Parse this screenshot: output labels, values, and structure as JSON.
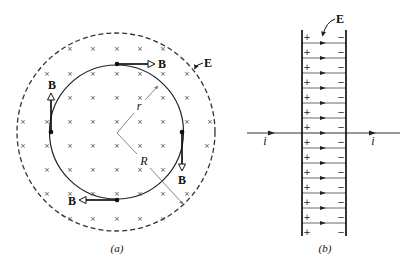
{
  "figure_a": {
    "caption": "(a)",
    "field_label": "E",
    "magnetic_label": "B",
    "inner_radius_label": "r",
    "outer_radius_label": "R",
    "cross_glyph": "×",
    "crosses": [
      [
        70,
        48
      ],
      [
        93,
        48
      ],
      [
        117,
        48
      ],
      [
        140,
        48
      ],
      [
        163,
        48
      ],
      [
        47,
        73
      ],
      [
        70,
        73
      ],
      [
        93,
        73
      ],
      [
        117,
        73
      ],
      [
        140,
        73
      ],
      [
        163,
        73
      ],
      [
        187,
        73
      ],
      [
        70,
        97
      ],
      [
        93,
        97
      ],
      [
        117,
        97
      ],
      [
        140,
        97
      ],
      [
        163,
        97
      ],
      [
        187,
        97
      ],
      [
        23,
        121
      ],
      [
        47,
        121
      ],
      [
        70,
        121
      ],
      [
        93,
        121
      ],
      [
        117,
        121
      ],
      [
        140,
        121
      ],
      [
        163,
        121
      ],
      [
        187,
        121
      ],
      [
        210,
        121
      ],
      [
        23,
        145
      ],
      [
        47,
        145
      ],
      [
        70,
        145
      ],
      [
        93,
        145
      ],
      [
        117,
        145
      ],
      [
        140,
        145
      ],
      [
        163,
        145
      ],
      [
        207,
        145
      ],
      [
        47,
        169
      ],
      [
        70,
        169
      ],
      [
        93,
        169
      ],
      [
        117,
        169
      ],
      [
        140,
        169
      ],
      [
        163,
        169
      ],
      [
        47,
        193
      ],
      [
        70,
        193
      ],
      [
        93,
        193
      ],
      [
        117,
        193
      ],
      [
        140,
        193
      ],
      [
        163,
        193
      ],
      [
        187,
        193
      ],
      [
        70,
        218
      ],
      [
        93,
        218
      ],
      [
        117,
        218
      ],
      [
        140,
        218
      ],
      [
        163,
        218
      ]
    ]
  },
  "figure_b": {
    "caption": "(b)",
    "field_label": "E",
    "current_label": "i",
    "plus_glyph": "+",
    "minus_glyph": "−",
    "field_lines_y": [
      43,
      58,
      73,
      88,
      103,
      118,
      133,
      148,
      163,
      178,
      193,
      208,
      223
    ],
    "sign_rows_y": [
      37,
      52,
      67,
      82,
      97,
      112,
      127,
      142,
      157,
      172,
      187,
      202,
      217,
      232
    ]
  }
}
